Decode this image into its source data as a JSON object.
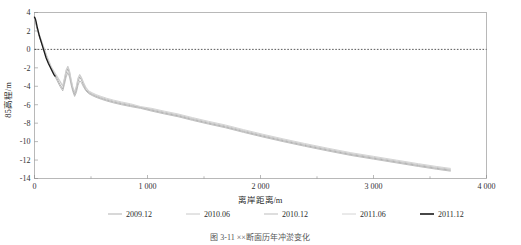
{
  "figure": {
    "caption": "图 3-11 ××断面历年冲淤变化",
    "background": "#ffffff"
  },
  "chart_data": {
    "type": "line",
    "title": "",
    "subtitle": "",
    "xlabel": "离岸距离/m",
    "ylabel": "85高程/m",
    "xlim": [
      0,
      4000
    ],
    "ylim": [
      -14,
      4
    ],
    "xticks": [
      0,
      1000,
      2000,
      3000,
      4000
    ],
    "xtick_labels": [
      "0",
      "1 000",
      "2 000",
      "3 000",
      "4 000"
    ],
    "xminor_ticks": [
      500,
      1500,
      2500,
      3500
    ],
    "yticks": [
      4,
      2,
      0,
      -2,
      -4,
      -6,
      -8,
      -10,
      -12,
      -14
    ],
    "ytick_labels": [
      "4",
      "2",
      "0",
      "-2",
      "-4",
      "-6",
      "-8",
      "-10",
      "-12",
      "-14"
    ],
    "grid": false,
    "zero_reference_line": {
      "y": 0,
      "style": "dotted",
      "color": "#111111"
    },
    "legend_position": "below",
    "series": [
      {
        "name": "2009.12",
        "color": "#a8a8a8",
        "width": 0.9,
        "points": [
          [
            0,
            3.3
          ],
          [
            15,
            2.6
          ],
          [
            30,
            1.9
          ],
          [
            50,
            1.1
          ],
          [
            70,
            0.4
          ],
          [
            90,
            -0.3
          ],
          [
            110,
            -1.0
          ],
          [
            130,
            -1.6
          ],
          [
            150,
            -2.1
          ],
          [
            175,
            -2.6
          ],
          [
            200,
            -3.2
          ],
          [
            225,
            -3.8
          ],
          [
            250,
            -4.3
          ],
          [
            265,
            -3.5
          ],
          [
            280,
            -2.6
          ],
          [
            295,
            -2.1
          ],
          [
            310,
            -2.6
          ],
          [
            325,
            -3.6
          ],
          [
            340,
            -4.4
          ],
          [
            355,
            -4.9
          ],
          [
            370,
            -4.4
          ],
          [
            385,
            -3.5
          ],
          [
            400,
            -3.0
          ],
          [
            415,
            -3.3
          ],
          [
            435,
            -3.9
          ],
          [
            455,
            -4.4
          ],
          [
            480,
            -4.7
          ],
          [
            510,
            -4.9
          ],
          [
            545,
            -5.1
          ],
          [
            590,
            -5.3
          ],
          [
            640,
            -5.5
          ],
          [
            700,
            -5.7
          ],
          [
            770,
            -5.9
          ],
          [
            850,
            -6.1
          ],
          [
            940,
            -6.3
          ],
          [
            1040,
            -6.6
          ],
          [
            1150,
            -6.9
          ],
          [
            1270,
            -7.2
          ],
          [
            1400,
            -7.6
          ],
          [
            1540,
            -8.0
          ],
          [
            1690,
            -8.4
          ],
          [
            1850,
            -8.9
          ],
          [
            2020,
            -9.4
          ],
          [
            2200,
            -9.9
          ],
          [
            2390,
            -10.4
          ],
          [
            2590,
            -10.9
          ],
          [
            2800,
            -11.4
          ],
          [
            3000,
            -11.8
          ],
          [
            3200,
            -12.2
          ],
          [
            3400,
            -12.6
          ],
          [
            3560,
            -12.9
          ],
          [
            3680,
            -13.1
          ]
        ]
      },
      {
        "name": "2010.06",
        "color": "#c2c2c2",
        "width": 0.9,
        "points": [
          [
            0,
            3.5
          ],
          [
            15,
            2.8
          ],
          [
            30,
            2.1
          ],
          [
            50,
            1.3
          ],
          [
            70,
            0.6
          ],
          [
            90,
            -0.1
          ],
          [
            110,
            -0.8
          ],
          [
            130,
            -1.4
          ],
          [
            150,
            -2.0
          ],
          [
            175,
            -2.5
          ],
          [
            200,
            -3.0
          ],
          [
            225,
            -3.5
          ],
          [
            250,
            -4.0
          ],
          [
            265,
            -3.2
          ],
          [
            280,
            -2.3
          ],
          [
            295,
            -1.9
          ],
          [
            310,
            -2.4
          ],
          [
            325,
            -3.4
          ],
          [
            340,
            -4.2
          ],
          [
            355,
            -4.7
          ],
          [
            370,
            -4.1
          ],
          [
            385,
            -3.2
          ],
          [
            400,
            -2.8
          ],
          [
            415,
            -3.1
          ],
          [
            435,
            -3.7
          ],
          [
            455,
            -4.2
          ],
          [
            480,
            -4.6
          ],
          [
            510,
            -4.8
          ],
          [
            545,
            -5.0
          ],
          [
            590,
            -5.2
          ],
          [
            640,
            -5.4
          ],
          [
            700,
            -5.6
          ],
          [
            770,
            -5.8
          ],
          [
            850,
            -6.0
          ],
          [
            940,
            -6.3
          ],
          [
            1040,
            -6.5
          ],
          [
            1150,
            -6.8
          ],
          [
            1270,
            -7.1
          ],
          [
            1400,
            -7.5
          ],
          [
            1540,
            -7.9
          ],
          [
            1690,
            -8.3
          ],
          [
            1850,
            -8.8
          ],
          [
            2020,
            -9.3
          ],
          [
            2200,
            -9.8
          ],
          [
            2390,
            -10.3
          ],
          [
            2590,
            -10.8
          ],
          [
            2800,
            -11.3
          ],
          [
            3000,
            -11.7
          ],
          [
            3200,
            -12.1
          ],
          [
            3400,
            -12.5
          ],
          [
            3560,
            -12.8
          ],
          [
            3680,
            -13.0
          ]
        ]
      },
      {
        "name": "2010.12",
        "color": "#b5b5b5",
        "width": 0.9,
        "points": [
          [
            0,
            3.4
          ],
          [
            15,
            2.7
          ],
          [
            30,
            2.0
          ],
          [
            50,
            1.2
          ],
          [
            70,
            0.5
          ],
          [
            90,
            -0.2
          ],
          [
            110,
            -0.9
          ],
          [
            130,
            -1.5
          ],
          [
            150,
            -2.2
          ],
          [
            175,
            -2.8
          ],
          [
            200,
            -3.4
          ],
          [
            225,
            -4.0
          ],
          [
            250,
            -4.5
          ],
          [
            265,
            -3.8
          ],
          [
            280,
            -3.0
          ],
          [
            295,
            -2.5
          ],
          [
            310,
            -3.0
          ],
          [
            325,
            -3.9
          ],
          [
            340,
            -4.6
          ],
          [
            355,
            -5.1
          ],
          [
            370,
            -4.7
          ],
          [
            385,
            -3.9
          ],
          [
            400,
            -3.4
          ],
          [
            415,
            -3.6
          ],
          [
            435,
            -4.1
          ],
          [
            455,
            -4.5
          ],
          [
            480,
            -4.8
          ],
          [
            510,
            -5.0
          ],
          [
            545,
            -5.2
          ],
          [
            590,
            -5.4
          ],
          [
            640,
            -5.6
          ],
          [
            700,
            -5.8
          ],
          [
            770,
            -6.0
          ],
          [
            850,
            -6.2
          ],
          [
            940,
            -6.4
          ],
          [
            1040,
            -6.7
          ],
          [
            1150,
            -7.0
          ],
          [
            1270,
            -7.3
          ],
          [
            1400,
            -7.7
          ],
          [
            1540,
            -8.1
          ],
          [
            1690,
            -8.5
          ],
          [
            1850,
            -9.0
          ],
          [
            2020,
            -9.5
          ],
          [
            2200,
            -10.0
          ],
          [
            2390,
            -10.5
          ],
          [
            2590,
            -11.0
          ],
          [
            2800,
            -11.5
          ],
          [
            3000,
            -11.9
          ],
          [
            3200,
            -12.3
          ],
          [
            3400,
            -12.7
          ],
          [
            3560,
            -13.0
          ],
          [
            3680,
            -13.2
          ]
        ]
      },
      {
        "name": "2011.06",
        "color": "#cfcfcf",
        "width": 0.9,
        "points": [
          [
            0,
            3.6
          ],
          [
            15,
            2.9
          ],
          [
            30,
            2.2
          ],
          [
            50,
            1.4
          ],
          [
            70,
            0.7
          ],
          [
            90,
            0.0
          ],
          [
            110,
            -0.7
          ],
          [
            130,
            -1.3
          ],
          [
            150,
            -1.9
          ],
          [
            175,
            -2.4
          ],
          [
            200,
            -2.9
          ],
          [
            225,
            -3.4
          ],
          [
            250,
            -3.9
          ],
          [
            265,
            -3.1
          ],
          [
            280,
            -2.2
          ],
          [
            295,
            -1.8
          ],
          [
            310,
            -2.3
          ],
          [
            325,
            -3.3
          ],
          [
            340,
            -4.1
          ],
          [
            355,
            -4.6
          ],
          [
            370,
            -4.0
          ],
          [
            385,
            -3.1
          ],
          [
            400,
            -2.7
          ],
          [
            415,
            -3.0
          ],
          [
            435,
            -3.6
          ],
          [
            455,
            -4.1
          ],
          [
            480,
            -4.5
          ],
          [
            510,
            -4.7
          ],
          [
            545,
            -4.9
          ],
          [
            590,
            -5.1
          ],
          [
            640,
            -5.3
          ],
          [
            700,
            -5.5
          ],
          [
            770,
            -5.7
          ],
          [
            850,
            -5.9
          ],
          [
            940,
            -6.2
          ],
          [
            1040,
            -6.4
          ],
          [
            1150,
            -6.7
          ],
          [
            1270,
            -7.0
          ],
          [
            1400,
            -7.4
          ],
          [
            1540,
            -7.8
          ],
          [
            1690,
            -8.2
          ],
          [
            1850,
            -8.7
          ],
          [
            2020,
            -9.2
          ],
          [
            2200,
            -9.7
          ],
          [
            2390,
            -10.2
          ],
          [
            2590,
            -10.7
          ],
          [
            2800,
            -11.2
          ],
          [
            3000,
            -11.6
          ],
          [
            3200,
            -12.0
          ],
          [
            3400,
            -12.4
          ],
          [
            3560,
            -12.7
          ],
          [
            3680,
            -12.9
          ]
        ]
      },
      {
        "name": "2011.12",
        "color": "#1a1a1a",
        "width": 1.3,
        "points": [
          [
            0,
            3.5
          ],
          [
            8,
            3.3
          ],
          [
            16,
            2.9
          ],
          [
            24,
            2.4
          ],
          [
            32,
            2.0
          ],
          [
            42,
            1.5
          ],
          [
            52,
            1.1
          ],
          [
            62,
            0.7
          ],
          [
            72,
            0.3
          ],
          [
            82,
            -0.1
          ],
          [
            92,
            -0.5
          ],
          [
            102,
            -0.9
          ],
          [
            112,
            -1.2
          ],
          [
            122,
            -1.5
          ],
          [
            134,
            -1.8
          ],
          [
            146,
            -2.1
          ],
          [
            158,
            -2.4
          ],
          [
            170,
            -2.7
          ],
          [
            182,
            -2.9
          ]
        ]
      }
    ]
  },
  "legend": {
    "entries": [
      {
        "label": "2009.12",
        "color": "#a8a8a8"
      },
      {
        "label": "2010.06",
        "color": "#c2c2c2"
      },
      {
        "label": "2010.12",
        "color": "#b5b5b5"
      },
      {
        "label": "2011.06",
        "color": "#cfcfcf"
      },
      {
        "label": "2011.12",
        "color": "#1a1a1a"
      }
    ]
  }
}
